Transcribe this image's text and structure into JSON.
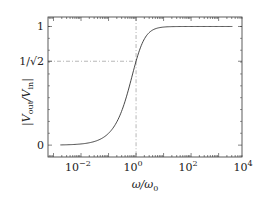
{
  "chart_data": {
    "type": "line",
    "title": "",
    "xlabel": "ω/ω0",
    "ylabel": "|Vout/Vin|",
    "xscale": "log",
    "xlim_log10": [
      -3.2,
      3.85
    ],
    "ylim": [
      -0.1,
      1.08
    ],
    "grid": false,
    "legend": "none",
    "x_ticks": [
      {
        "exp": -2,
        "base": "10",
        "sup": "−2"
      },
      {
        "exp": 0,
        "base": "10",
        "sup": "0"
      },
      {
        "exp": 2,
        "base": "10",
        "sup": "2"
      },
      {
        "exp": 4,
        "base": "10",
        "sup": "4"
      }
    ],
    "y_ticks": [
      {
        "value": 0,
        "label": "0"
      },
      {
        "value": 0.7071,
        "label": "1/√2"
      },
      {
        "value": 1,
        "label": "1"
      }
    ],
    "series": [
      {
        "name": "high-pass magnitude",
        "formula": "(w)/sqrt(1+w^2)",
        "x_log10_range": [
          -2.75,
          3.5
        ],
        "color": "#333333"
      }
    ],
    "reference_lines": [
      {
        "orientation": "horizontal",
        "value": 0.7071,
        "style": "dash-dot",
        "color": "#999999"
      },
      {
        "orientation": "vertical",
        "value_log10": 0,
        "style": "dash-dot",
        "color": "#999999"
      }
    ]
  }
}
